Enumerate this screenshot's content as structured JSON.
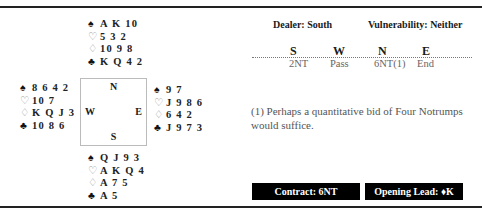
{
  "hands": {
    "north": {
      "spades": "A K 10",
      "hearts": "5 3 2",
      "diamonds": "10 9 8",
      "clubs": "K Q 4 2"
    },
    "west": {
      "spades": "8 6 4 2",
      "hearts": "10 7",
      "diamonds": "K Q J 3",
      "clubs": "10 8 6"
    },
    "east": {
      "spades": "9 7",
      "hearts": "J 9 8 6",
      "diamonds": "6 4 2",
      "clubs": "J 9 7 3"
    },
    "south": {
      "spades": "Q J 9 3",
      "hearts": "A K Q 4",
      "diamonds": "A 7 5",
      "clubs": "A 5"
    }
  },
  "suits": {
    "spade": "♠",
    "heart": "♡",
    "diamond": "♢",
    "club": "♣"
  },
  "compass": {
    "n": "N",
    "s": "S",
    "w": "W",
    "e": "E"
  },
  "deal": {
    "dealer": "Dealer: South",
    "vulnerability": "Vulnerability: Neither"
  },
  "auction": {
    "headers": [
      "S",
      "W",
      "N",
      "E"
    ],
    "bids": [
      "2NT",
      "Pass",
      "6NT(1)",
      "End"
    ]
  },
  "note": "(1) Perhaps a quantitative bid of Four Notrumps would suffice.",
  "contract": "Contract: 6NT",
  "opening_lead": "Opening Lead: ♦K"
}
